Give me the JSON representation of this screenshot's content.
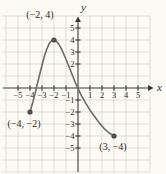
{
  "chart_data": {
    "type": "line",
    "title": "",
    "xlabel": "x",
    "ylabel": "y",
    "xlim": [
      -6,
      6
    ],
    "ylim": [
      -7,
      6
    ],
    "grid": true,
    "x_tick_values": [
      -5,
      -4,
      -3,
      -2,
      -1,
      1,
      2,
      3,
      4,
      5
    ],
    "x_tick_labels": [
      "−5",
      "−4",
      "−3",
      "−2",
      "−1",
      "1",
      "2",
      "3",
      "4",
      "5"
    ],
    "y_tick_values": [
      5,
      4,
      3,
      2,
      -1,
      -2,
      -3,
      -4,
      -5
    ],
    "y_tick_labels": [
      "5",
      "4",
      "3",
      "2",
      "−1",
      "−2",
      "−3",
      "−4",
      "−5"
    ],
    "points": [
      {
        "x": -2,
        "y": 4,
        "label": "(−2, 4)",
        "label_dx": -14,
        "label_dy": -22
      },
      {
        "x": -4,
        "y": -2,
        "label": "(−4, −2)",
        "label_dx": -6,
        "label_dy": 15
      },
      {
        "x": 3,
        "y": -4,
        "label": "(3, −4)",
        "label_dx": -1,
        "label_dy": 14
      }
    ],
    "curve_samples": [
      [
        -4,
        -2
      ],
      [
        -3.8,
        -1.3
      ],
      [
        -3.6,
        -0.55
      ],
      [
        -3.4,
        0.3
      ],
      [
        -3.2,
        1.1
      ],
      [
        -3.0,
        1.9
      ],
      [
        -2.8,
        2.65
      ],
      [
        -2.6,
        3.25
      ],
      [
        -2.4,
        3.7
      ],
      [
        -2.2,
        3.93
      ],
      [
        -2,
        4
      ],
      [
        -1.8,
        3.9
      ],
      [
        -1.6,
        3.65
      ],
      [
        -1.4,
        3.3
      ],
      [
        -1.2,
        2.85
      ],
      [
        -1.0,
        2.4
      ],
      [
        -0.8,
        1.9
      ],
      [
        -0.6,
        1.4
      ],
      [
        -0.4,
        0.9
      ],
      [
        -0.2,
        0.4
      ],
      [
        0,
        -0.05
      ],
      [
        0.3,
        -0.65
      ],
      [
        0.6,
        -1.2
      ],
      [
        1,
        -1.85
      ],
      [
        1.4,
        -2.4
      ],
      [
        1.8,
        -2.95
      ],
      [
        2.2,
        -3.4
      ],
      [
        2.6,
        -3.75
      ],
      [
        3,
        -4
      ]
    ],
    "colors": {
      "background": "#fcfaf5",
      "grid": "#dbd7cb",
      "axis": "#3d3a36",
      "curve": "#6b6b6b",
      "point": "#4f4f4f",
      "text": "#2e2a26"
    }
  }
}
